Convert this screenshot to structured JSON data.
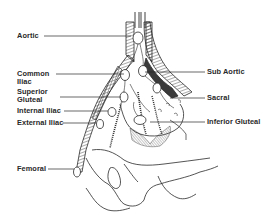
{
  "diagram": {
    "type": "anatomical-illustration",
    "colors": {
      "line": "#2a2a2a",
      "background": "#ffffff",
      "shading": "#555555"
    },
    "labels_left": [
      {
        "id": "aortic",
        "text": "Aortic"
      },
      {
        "id": "common-iliac",
        "text": "Common",
        "text2": "Iliac"
      },
      {
        "id": "superior-gluteal",
        "text": "Superior",
        "text2": "Gluteal"
      },
      {
        "id": "internal-iliac",
        "text": "Internal Iliac"
      },
      {
        "id": "external-iliac",
        "text": "External Iliac"
      },
      {
        "id": "femoral",
        "text": "Femoral"
      }
    ],
    "labels_right": [
      {
        "id": "sub-aortic",
        "text": "Sub Aortic"
      },
      {
        "id": "sacral",
        "text": "Sacral"
      },
      {
        "id": "inferior-gluteal",
        "text": "Inferior Gluteal"
      }
    ]
  }
}
